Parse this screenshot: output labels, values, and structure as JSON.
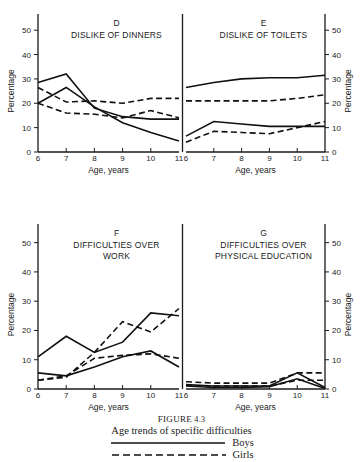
{
  "figure": {
    "number_label": "FIGURE",
    "number": "4.3",
    "title": "Age trends of specific difficulties"
  },
  "legend": {
    "position": "bottom-center",
    "entries": [
      {
        "label": "Boys",
        "style": "solid"
      },
      {
        "label": "Girls",
        "style": "dashed"
      }
    ]
  },
  "axes": {
    "xlabel": "Age, years",
    "ylabel": "Percentage",
    "xticks": [
      "6",
      "7",
      "8",
      "9",
      "10",
      "11"
    ],
    "yticks": [
      "0",
      "10",
      "20",
      "30",
      "40",
      "50"
    ],
    "xlim": [
      6,
      11
    ],
    "ylim": [
      0,
      55
    ],
    "grid": false
  },
  "chart_data": {
    "type": "line",
    "title": "Age trends of specific difficulties",
    "xlabel": "Age, years",
    "ylabel": "Percentage",
    "xlim": [
      6,
      11
    ],
    "ylim": [
      0,
      55
    ],
    "grid": false,
    "legend": [
      "Boys",
      "Girls"
    ],
    "x": [
      6,
      7,
      8,
      9,
      10,
      11
    ],
    "panels": [
      {
        "id": "D",
        "letter": "D",
        "title": "DISLIKE OF DINNERS",
        "title_lines": [
          "DISLIKE OF DINNERS"
        ],
        "position": "top-left",
        "yaxis_side": "left",
        "series": [
          {
            "name": "Boys-1",
            "style": "solid",
            "values": [
              28.5,
              32.0,
              18.0,
              14.5,
              13.5,
              13.5
            ]
          },
          {
            "name": "Boys-2",
            "style": "solid",
            "values": [
              20.0,
              26.5,
              18.5,
              12.0,
              8.0,
              4.5
            ]
          },
          {
            "name": "Girls-1",
            "style": "dashed",
            "values": [
              26.5,
              20.5,
              21.0,
              20.0,
              22.0,
              22.0
            ]
          },
          {
            "name": "Girls-2",
            "style": "dashed",
            "values": [
              20.0,
              16.0,
              15.5,
              14.0,
              17.0,
              14.0
            ]
          }
        ]
      },
      {
        "id": "E",
        "letter": "E",
        "title": "DISLIKE OF TOILETS",
        "title_lines": [
          "DISLIKE OF TOILETS"
        ],
        "position": "top-right",
        "yaxis_side": "right",
        "series": [
          {
            "name": "Boys-1",
            "style": "solid",
            "values": [
              26.5,
              28.5,
              30.0,
              30.5,
              30.5,
              31.5
            ]
          },
          {
            "name": "Boys-2",
            "style": "solid",
            "values": [
              6.5,
              12.5,
              11.5,
              10.5,
              10.5,
              10.5
            ]
          },
          {
            "name": "Girls-1",
            "style": "dashed",
            "values": [
              21.0,
              21.0,
              21.0,
              21.0,
              22.0,
              23.5
            ]
          },
          {
            "name": "Girls-2",
            "style": "dashed",
            "values": [
              4.0,
              8.5,
              8.0,
              7.5,
              10.0,
              12.5
            ]
          }
        ]
      },
      {
        "id": "F",
        "letter": "F",
        "title": "DIFFICULTIES OVER WORK",
        "title_lines": [
          "DIFFICULTIES OVER",
          "WORK"
        ],
        "position": "bottom-left",
        "yaxis_side": "left",
        "series": [
          {
            "name": "Boys-1",
            "style": "solid",
            "values": [
              11.0,
              18.0,
              12.5,
              16.0,
              26.0,
              25.0
            ]
          },
          {
            "name": "Boys-2",
            "style": "solid",
            "values": [
              5.5,
              4.5,
              7.5,
              11.0,
              13.0,
              7.5
            ]
          },
          {
            "name": "Girls-1",
            "style": "dashed",
            "values": [
              3.0,
              4.0,
              12.5,
              23.0,
              19.5,
              27.5
            ]
          },
          {
            "name": "Girls-2",
            "style": "dashed",
            "values": [
              3.0,
              4.5,
              10.5,
              11.5,
              12.0,
              10.5
            ]
          }
        ]
      },
      {
        "id": "G",
        "letter": "G",
        "title": "DIFFICULTIES OVER PHYSICAL EDUCATION",
        "title_lines": [
          "DIFFICULTIES OVER",
          "PHYSICAL  EDUCATION"
        ],
        "position": "bottom-right",
        "yaxis_side": "right",
        "series": [
          {
            "name": "Boys-1",
            "style": "solid",
            "values": [
              1.5,
              1.0,
              1.0,
              1.0,
              5.5,
              0.5
            ]
          },
          {
            "name": "Boys-2",
            "style": "solid",
            "values": [
              1.0,
              0.5,
              0.5,
              0.8,
              3.5,
              0.2
            ]
          },
          {
            "name": "Girls-1",
            "style": "dashed",
            "values": [
              2.5,
              2.0,
              2.0,
              2.0,
              5.5,
              5.5
            ]
          },
          {
            "name": "Girls-2",
            "style": "dashed",
            "values": [
              1.2,
              1.0,
              1.0,
              1.0,
              3.0,
              3.0
            ]
          }
        ]
      }
    ]
  }
}
